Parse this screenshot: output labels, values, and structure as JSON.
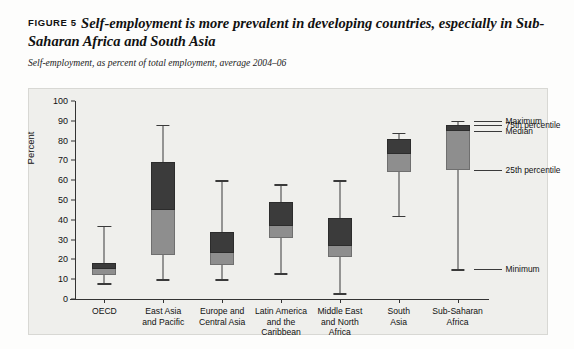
{
  "figure": {
    "number_label": "FIGURE 5",
    "title": "Self-employment is more prevalent in developing countries, especially in Sub-Saharan Africa and South Asia",
    "subtitle": "Self-employment, as percent of total employment, average 2004–06"
  },
  "chart_data": {
    "type": "box",
    "title": "Self-employment is more prevalent in developing countries, especially in Sub-Saharan Africa and South Asia",
    "subtitle": "Self-employment, as percent of total employment, average 2004–06",
    "xlabel": "",
    "ylabel": "Percent",
    "ylim": [
      0,
      100
    ],
    "yticks": [
      0,
      10,
      20,
      30,
      40,
      50,
      60,
      70,
      80,
      90,
      100
    ],
    "ytick_labels": [
      "0",
      "10",
      "20",
      "30",
      "40",
      "50",
      "60",
      "70",
      "80",
      "90",
      "100"
    ],
    "grid": false,
    "legend": "annotations-right",
    "categories": [
      "OECD",
      "East Asia and Pacific",
      "Europe and Central Asia",
      "Latin America and the Caribbean",
      "Middle East and North Africa",
      "South Asia",
      "Sub-Saharan Africa"
    ],
    "category_lines": [
      [
        "OECD"
      ],
      [
        "East Asia",
        "and Pacific"
      ],
      [
        "Europe and",
        "Central Asia"
      ],
      [
        "Latin America",
        "and the",
        "Caribbean"
      ],
      [
        "Middle East",
        "and North",
        "Africa"
      ],
      [
        "South",
        "Asia"
      ],
      [
        "Sub-Saharan",
        "Africa"
      ]
    ],
    "series_keys": [
      "minimum",
      "p25",
      "median",
      "p75",
      "maximum"
    ],
    "boxes": [
      {
        "category": "OECD",
        "minimum": 8,
        "p25": 12,
        "median": 15,
        "p75": 18,
        "maximum": 37
      },
      {
        "category": "East Asia and Pacific",
        "minimum": 10,
        "p25": 22,
        "median": 45,
        "p75": 69,
        "maximum": 88
      },
      {
        "category": "Europe and Central Asia",
        "minimum": 10,
        "p25": 17,
        "median": 23,
        "p75": 34,
        "maximum": 60
      },
      {
        "category": "Latin America and the Caribbean",
        "minimum": 13,
        "p25": 31,
        "median": 37,
        "p75": 49,
        "maximum": 58
      },
      {
        "category": "Middle East and North Africa",
        "minimum": 3,
        "p25": 21,
        "median": 27,
        "p75": 41,
        "maximum": 60
      },
      {
        "category": "South Asia",
        "minimum": 42,
        "p25": 64,
        "median": 73,
        "p75": 81,
        "maximum": 84
      },
      {
        "category": "Sub-Saharan Africa",
        "minimum": 15,
        "p25": 65,
        "median": 85,
        "p75": 88,
        "maximum": 90
      }
    ],
    "annotations": [
      {
        "key": "maximum",
        "label": "Maximum",
        "value": 90
      },
      {
        "key": "p75",
        "label": "75th percentile",
        "value": 88
      },
      {
        "key": "median",
        "label": "Median",
        "value": 85
      },
      {
        "key": "p25",
        "label": "25th percentile",
        "value": 65
      },
      {
        "key": "minimum",
        "label": "Minimum",
        "value": 15
      }
    ],
    "colors": {
      "box_upper": "#3b3b3b",
      "box_lower": "#8e8e8e",
      "whisker": "#3a3a3a",
      "plot_background": "#efefec",
      "page_background": "#ffffff",
      "axis": "#333333",
      "text": "#111111"
    }
  }
}
